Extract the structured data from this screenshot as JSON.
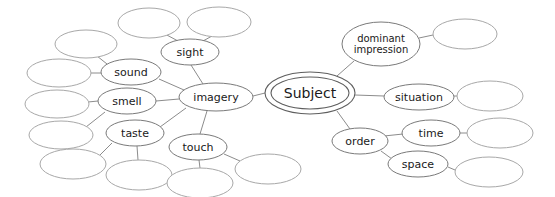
{
  "diagram": {
    "type": "mind-map",
    "background_color": "#ffffff",
    "stroke_color": "#7a7a7a",
    "empty_stroke_color": "#a8a8a8",
    "text_color": "#1a1a1a",
    "root": {
      "id": "subject",
      "label": "Subject",
      "shape": "double-ellipse",
      "cx": 310,
      "cy": 93,
      "rx": 45,
      "ry": 21,
      "inner_rx": 39,
      "inner_ry": 16
    },
    "nodes": [
      {
        "id": "imagery",
        "label": "imagery",
        "cx": 216,
        "cy": 97,
        "rx": 37,
        "ry": 14,
        "size": "branch",
        "empty": false
      },
      {
        "id": "sight",
        "label": "sight",
        "cx": 190,
        "cy": 52,
        "rx": 29,
        "ry": 13,
        "size": "branch",
        "empty": false
      },
      {
        "id": "sound",
        "label": "sound",
        "cx": 131,
        "cy": 72,
        "rx": 30,
        "ry": 13,
        "size": "branch",
        "empty": false
      },
      {
        "id": "smell",
        "label": "smell",
        "cx": 127,
        "cy": 101,
        "rx": 29,
        "ry": 13,
        "size": "branch",
        "empty": false
      },
      {
        "id": "taste",
        "label": "taste",
        "cx": 135,
        "cy": 133,
        "rx": 29,
        "ry": 13,
        "size": "branch",
        "empty": false
      },
      {
        "id": "touch",
        "label": "touch",
        "cx": 198,
        "cy": 147,
        "rx": 29,
        "ry": 13,
        "size": "branch",
        "empty": false
      },
      {
        "id": "dominant-impression",
        "label": "dominant impression",
        "label_line1": "dominant",
        "label_line2": "impression",
        "cx": 381,
        "cy": 44,
        "rx": 39,
        "ry": 22,
        "size": "two-line",
        "empty": false
      },
      {
        "id": "situation",
        "label": "situation",
        "cx": 419,
        "cy": 97,
        "rx": 35,
        "ry": 13,
        "size": "branch",
        "empty": false
      },
      {
        "id": "order",
        "label": "order",
        "cx": 360,
        "cy": 141,
        "rx": 28,
        "ry": 13,
        "size": "branch",
        "empty": false
      },
      {
        "id": "time",
        "label": "time",
        "cx": 431,
        "cy": 133,
        "rx": 29,
        "ry": 13,
        "size": "branch",
        "empty": false
      },
      {
        "id": "space",
        "label": "space",
        "cx": 418,
        "cy": 164,
        "rx": 30,
        "ry": 13,
        "size": "branch",
        "empty": false
      },
      {
        "id": "sight-child-1",
        "label": "",
        "cx": 149,
        "cy": 23,
        "rx": 31,
        "ry": 15,
        "size": "leaf",
        "empty": true
      },
      {
        "id": "sight-child-2",
        "label": "",
        "cx": 219,
        "cy": 22,
        "rx": 32,
        "ry": 15,
        "size": "leaf",
        "empty": true
      },
      {
        "id": "sound-child-1",
        "label": "",
        "cx": 86,
        "cy": 44,
        "rx": 31,
        "ry": 14,
        "size": "leaf",
        "empty": true
      },
      {
        "id": "sound-child-2",
        "label": "",
        "cx": 59,
        "cy": 73,
        "rx": 32,
        "ry": 14,
        "size": "leaf",
        "empty": true
      },
      {
        "id": "smell-child-1",
        "label": "",
        "cx": 57,
        "cy": 104,
        "rx": 32,
        "ry": 14,
        "size": "leaf",
        "empty": true
      },
      {
        "id": "taste-child-1",
        "label": "",
        "cx": 61,
        "cy": 135,
        "rx": 32,
        "ry": 14,
        "size": "leaf",
        "empty": true
      },
      {
        "id": "taste-child-2",
        "label": "",
        "cx": 73,
        "cy": 164,
        "rx": 33,
        "ry": 15,
        "size": "leaf",
        "empty": true
      },
      {
        "id": "taste-child-3",
        "label": "",
        "cx": 139,
        "cy": 175,
        "rx": 33,
        "ry": 15,
        "size": "leaf",
        "empty": true
      },
      {
        "id": "touch-child-1",
        "label": "",
        "cx": 200,
        "cy": 183,
        "rx": 33,
        "ry": 15,
        "size": "leaf",
        "empty": true
      },
      {
        "id": "touch-child-2",
        "label": "",
        "cx": 268,
        "cy": 169,
        "rx": 33,
        "ry": 15,
        "size": "leaf",
        "empty": true
      },
      {
        "id": "dominant-child-1",
        "label": "",
        "cx": 465,
        "cy": 34,
        "rx": 32,
        "ry": 15,
        "size": "leaf",
        "empty": true
      },
      {
        "id": "situation-child-1",
        "label": "",
        "cx": 490,
        "cy": 96,
        "rx": 33,
        "ry": 15,
        "size": "leaf",
        "empty": true
      },
      {
        "id": "time-child-1",
        "label": "",
        "cx": 500,
        "cy": 133,
        "rx": 33,
        "ry": 15,
        "size": "leaf",
        "empty": true
      },
      {
        "id": "space-child-1",
        "label": "",
        "cx": 489,
        "cy": 172,
        "rx": 34,
        "ry": 15,
        "size": "leaf",
        "empty": true
      }
    ],
    "edges": [
      {
        "from": "subject",
        "to": "imagery",
        "x1": 265,
        "y1": 93,
        "x2": 253,
        "y2": 96
      },
      {
        "from": "subject",
        "to": "dominant-impression",
        "x1": 337,
        "y1": 76,
        "x2": 354,
        "y2": 61
      },
      {
        "from": "subject",
        "to": "situation",
        "x1": 355,
        "y1": 95,
        "x2": 384,
        "y2": 96
      },
      {
        "from": "subject",
        "to": "order",
        "x1": 337,
        "y1": 111,
        "x2": 350,
        "y2": 129
      },
      {
        "from": "imagery",
        "to": "sight",
        "x1": 203,
        "y1": 84,
        "x2": 191,
        "y2": 65
      },
      {
        "from": "imagery",
        "to": "sound",
        "x1": 184,
        "y1": 90,
        "x2": 159,
        "y2": 79
      },
      {
        "from": "imagery",
        "to": "smell",
        "x1": 179,
        "y1": 99,
        "x2": 156,
        "y2": 101
      },
      {
        "from": "imagery",
        "to": "taste",
        "x1": 186,
        "y1": 108,
        "x2": 160,
        "y2": 127
      },
      {
        "from": "imagery",
        "to": "touch",
        "x1": 207,
        "y1": 111,
        "x2": 200,
        "y2": 134
      },
      {
        "from": "sight",
        "to": "sight-child-1",
        "x1": 178,
        "y1": 41,
        "x2": 165,
        "y2": 34
      },
      {
        "from": "sight",
        "to": "sight-child-2",
        "x1": 203,
        "y1": 41,
        "x2": 212,
        "y2": 36
      },
      {
        "from": "sound",
        "to": "sound-child-1",
        "x1": 107,
        "y1": 64,
        "x2": 97,
        "y2": 56
      },
      {
        "from": "sound",
        "to": "sound-child-2",
        "x1": 101,
        "y1": 73,
        "x2": 90,
        "y2": 73
      },
      {
        "from": "smell",
        "to": "smell-child-1",
        "x1": 98,
        "y1": 101,
        "x2": 88,
        "y2": 102
      },
      {
        "from": "smell",
        "to": "taste-child-1",
        "x1": 105,
        "y1": 112,
        "x2": 86,
        "y2": 127
      },
      {
        "from": "taste",
        "to": "taste-child-2",
        "x1": 112,
        "y1": 143,
        "x2": 100,
        "y2": 155
      },
      {
        "from": "taste",
        "to": "taste-child-3",
        "x1": 137,
        "y1": 146,
        "x2": 138,
        "y2": 160
      },
      {
        "from": "touch",
        "to": "touch-child-1",
        "x1": 199,
        "y1": 160,
        "x2": 200,
        "y2": 168
      },
      {
        "from": "touch",
        "to": "touch-child-2",
        "x1": 224,
        "y1": 154,
        "x2": 240,
        "y2": 161
      },
      {
        "from": "dominant-impression",
        "to": "dominant-child-1",
        "x1": 419,
        "y1": 38,
        "x2": 433,
        "y2": 35
      },
      {
        "from": "situation",
        "to": "situation-child-1",
        "x1": 454,
        "y1": 96,
        "x2": 457,
        "y2": 96
      },
      {
        "from": "order",
        "to": "time",
        "x1": 384,
        "y1": 136,
        "x2": 403,
        "y2": 134
      },
      {
        "from": "order",
        "to": "space",
        "x1": 381,
        "y1": 151,
        "x2": 392,
        "y2": 159
      },
      {
        "from": "time",
        "to": "time-child-1",
        "x1": 460,
        "y1": 133,
        "x2": 467,
        "y2": 133
      },
      {
        "from": "space",
        "to": "space-child-1",
        "x1": 448,
        "y1": 167,
        "x2": 455,
        "y2": 170
      }
    ]
  }
}
